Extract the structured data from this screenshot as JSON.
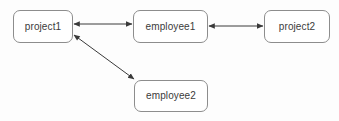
{
  "diagram": {
    "type": "entity-relationship-graph",
    "background_color": "#fdfdfd",
    "node_fill": "#ffffff",
    "node_border_color": "#8d8d8d",
    "edge_color": "#3a3a3a",
    "text_color": "#3b3b3b",
    "nodes": [
      {
        "id": "project1",
        "label": "project1",
        "x": 13,
        "y": 10,
        "width": 60,
        "height": 33
      },
      {
        "id": "employee1",
        "label": "employee1",
        "x": 133,
        "y": 10,
        "width": 75,
        "height": 33
      },
      {
        "id": "project2",
        "label": "project2",
        "x": 264,
        "y": 10,
        "width": 66,
        "height": 33
      },
      {
        "id": "employee2",
        "label": "employee2",
        "x": 134,
        "y": 80,
        "width": 74,
        "height": 32
      }
    ],
    "edges": [
      {
        "id": "project1-employee1",
        "from": "project1",
        "to": "employee1",
        "direction": "bidirectional",
        "x1": 74,
        "y1": 24,
        "x2": 132,
        "y2": 24
      },
      {
        "id": "employee1-project2",
        "from": "employee1",
        "to": "project2",
        "direction": "bidirectional",
        "x1": 209,
        "y1": 26,
        "x2": 263,
        "y2": 26
      },
      {
        "id": "project1-employee2",
        "from": "project1",
        "to": "employee2",
        "direction": "bidirectional",
        "x1": 74,
        "y1": 35,
        "x2": 134,
        "y2": 79
      }
    ]
  }
}
